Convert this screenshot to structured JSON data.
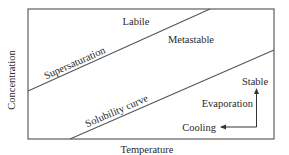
{
  "figure": {
    "type": "phase-diagram",
    "axes": {
      "x_label": "Temperature",
      "y_label": "Concentration"
    },
    "curves": [
      {
        "name": "supersaturation",
        "label": "Supersaturation"
      },
      {
        "name": "solubility",
        "label": "Solubility curve"
      }
    ],
    "regions": {
      "labile": "Labile",
      "metastable": "Metastable",
      "stable": "Stable"
    },
    "arrows": {
      "evaporation": "Evaporation",
      "cooling": "Cooling"
    },
    "colors": {
      "line": "#555555",
      "text": "#2a2a2a",
      "background": "#ffffff"
    }
  }
}
